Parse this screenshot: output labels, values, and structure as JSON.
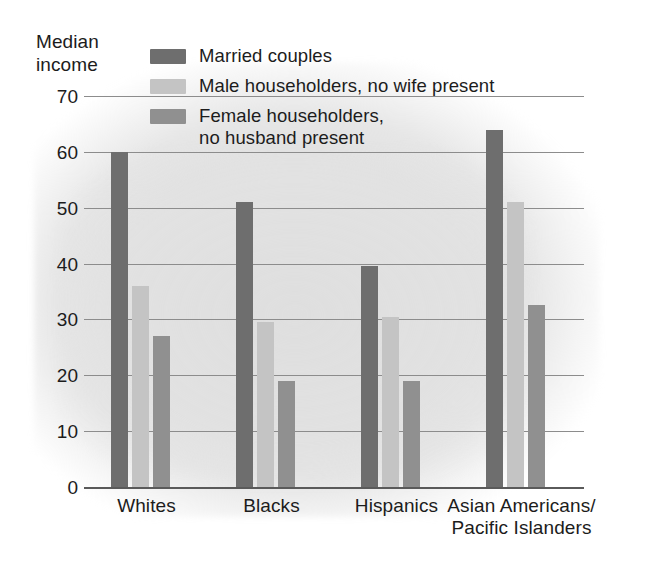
{
  "axis_title": "Median\nincome",
  "legend": {
    "items": [
      {
        "label": "Married couples",
        "color": "#6e6e6e",
        "key": "married"
      },
      {
        "label": "Male householders, no wife present",
        "color": "#c4c4c4",
        "key": "male"
      },
      {
        "label": "Female householders,\nno husband present",
        "color": "#909090",
        "key": "female"
      }
    ]
  },
  "colors": {
    "married": "#6e6e6e",
    "male": "#c4c4c4",
    "female": "#909090",
    "gridline": "#8c8c8c",
    "axis": "#5a5a5a",
    "background": "#ffffff",
    "plot_shade": "#e2e2e2"
  },
  "chart_data": {
    "type": "bar",
    "title": "",
    "subtitle": "",
    "xlabel": "",
    "ylabel": "Median income",
    "ylim": [
      0,
      70
    ],
    "yticks": [
      0,
      10,
      20,
      30,
      40,
      50,
      60,
      70
    ],
    "ytick_labels": [
      "0",
      "10",
      "20",
      "30",
      "40",
      "50",
      "60",
      "70"
    ],
    "grid": true,
    "legend_position": "top",
    "categories": [
      "Whites",
      "Blacks",
      "Hispanics",
      "Asian Americans/\nPacific Islanders"
    ],
    "series": [
      {
        "name": "Married couples",
        "color": "#6e6e6e",
        "values": [
          60,
          51,
          39.5,
          64
        ]
      },
      {
        "name": "Male householders, no wife present",
        "color": "#c4c4c4",
        "values": [
          36,
          29.5,
          30.5,
          51
        ]
      },
      {
        "name": "Female householders, no husband present",
        "color": "#909090",
        "values": [
          27,
          19,
          19,
          32.5
        ]
      }
    ]
  }
}
